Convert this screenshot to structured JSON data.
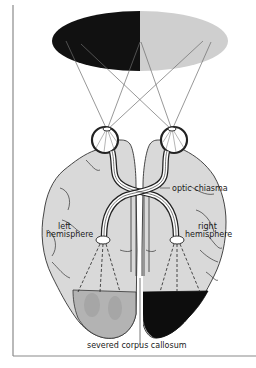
{
  "diagram": {
    "labels": {
      "optic_chiasma": "optic chiasma",
      "left_hemisphere_line1": "left",
      "left_hemisphere_line2": "hemisphere",
      "right_hemisphere_line1": "right",
      "right_hemisphere_line2": "hemisphere",
      "corpus_callosum": "severed corpus callosum"
    },
    "visual_field": {
      "left_half": "dark",
      "right_half": "light"
    },
    "colors": {
      "field_left": "#111111",
      "field_right": "#cfcfcf",
      "brain_fill": "#d9d9d9",
      "brain_outline": "#333333",
      "left_occipital": "#b3b3b3",
      "right_occipital": "#0d0d0d",
      "frame": "#8a8a8a",
      "ray": "#6b6b6b"
    }
  }
}
